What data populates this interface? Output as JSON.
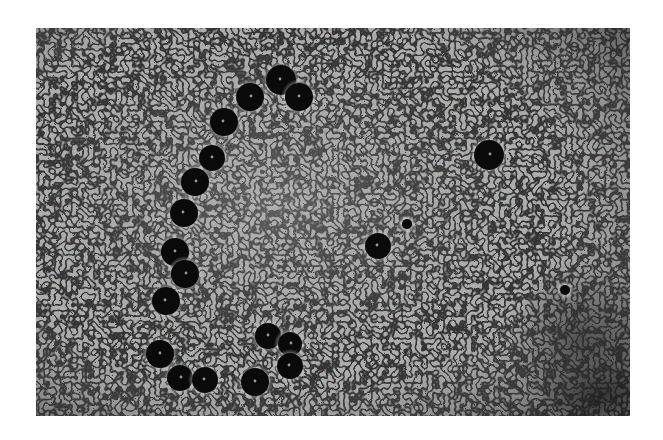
{
  "image": {
    "alt": "Grayscale phase-contrast micrograph showing a curved chain of dark spherical particles on a granular textured background, with two isolated dark particles to the right",
    "type": "grayscale micrograph",
    "background_tone": "#8c8c8c",
    "particle_color": "#0a0a0a",
    "frame": {
      "left": 36,
      "top": 28,
      "width": 594,
      "height": 388
    },
    "particles": [
      {
        "x": 281,
        "y": 80,
        "r": 15
      },
      {
        "x": 299,
        "y": 97,
        "r": 14
      },
      {
        "x": 250,
        "y": 97,
        "r": 14
      },
      {
        "x": 224,
        "y": 122,
        "r": 14
      },
      {
        "x": 212,
        "y": 158,
        "r": 13
      },
      {
        "x": 195,
        "y": 182,
        "r": 14
      },
      {
        "x": 184,
        "y": 213,
        "r": 14
      },
      {
        "x": 175,
        "y": 252,
        "r": 14
      },
      {
        "x": 185,
        "y": 274,
        "r": 14
      },
      {
        "x": 166,
        "y": 301,
        "r": 14
      },
      {
        "x": 160,
        "y": 354,
        "r": 14
      },
      {
        "x": 180,
        "y": 378,
        "r": 13
      },
      {
        "x": 205,
        "y": 380,
        "r": 13
      },
      {
        "x": 268,
        "y": 336,
        "r": 13
      },
      {
        "x": 290,
        "y": 344,
        "r": 12
      },
      {
        "x": 290,
        "y": 366,
        "r": 13
      },
      {
        "x": 255,
        "y": 382,
        "r": 14
      },
      {
        "x": 489,
        "y": 155,
        "r": 15
      },
      {
        "x": 378,
        "y": 246,
        "r": 13
      },
      {
        "x": 407,
        "y": 224,
        "r": 5
      },
      {
        "x": 565,
        "y": 290,
        "r": 5
      }
    ]
  }
}
